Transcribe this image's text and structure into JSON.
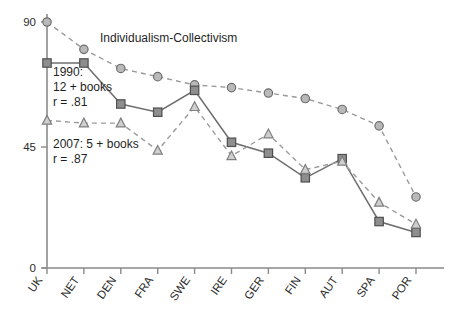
{
  "chart_data": {
    "type": "line",
    "title": "Individualism-Collectivism",
    "xlabel": "",
    "ylabel": "",
    "ylim": [
      0,
      90
    ],
    "yticks": [
      0,
      45,
      90
    ],
    "ytick_labels": [
      "0",
      "45",
      "90"
    ],
    "grid": false,
    "legend_position": "inline-annotation",
    "categories": [
      "UK",
      "NET",
      "DEN",
      "FRA",
      "SWE",
      "IRE",
      "GER",
      "FIN",
      "AUT",
      "SPA",
      "POR"
    ],
    "series": [
      {
        "name": "Individualism-Collectivism",
        "marker": "circle",
        "linestyle": "dashed",
        "values": [
          90,
          80,
          73,
          70,
          67,
          66,
          64,
          62,
          58,
          52,
          26
        ]
      },
      {
        "name": "1990: 12 + books",
        "marker": "square",
        "linestyle": "solid",
        "values": [
          75,
          75,
          60,
          57,
          65,
          46,
          42,
          33,
          40,
          17,
          13
        ]
      },
      {
        "name": "2007: 5 + books",
        "marker": "triangle",
        "linestyle": "dashed",
        "values": [
          54,
          53,
          53,
          43,
          59,
          41,
          49,
          36,
          39,
          24,
          16
        ]
      }
    ],
    "annotations": [
      {
        "id": "annot-1990",
        "lines": [
          "1990:",
          "12 + books",
          "r = .81"
        ]
      },
      {
        "id": "annot-2007",
        "lines": [
          "2007: 5 + books",
          "r = .87"
        ]
      }
    ],
    "colors": {
      "circle_fill": "#b9b9b9",
      "square_fill": "#8e8e8e",
      "triangle_fill": "#cfcfcf",
      "solid_line": "#6f6f6f",
      "dashed_line": "#9a9a9a",
      "axis": "#8a8a8a",
      "text": "#1f1f1f"
    }
  },
  "annotations": {
    "series_1990_label": "1990:",
    "series_1990_books": "12 + books",
    "series_1990_r": "r = .81",
    "series_2007_label": "2007: 5 + books",
    "series_2007_r": "r = .87",
    "title": "Individualism-Collectivism"
  },
  "axis": {
    "y_tick_top": "90",
    "y_tick_mid": "45",
    "y_tick_zero": "0"
  }
}
